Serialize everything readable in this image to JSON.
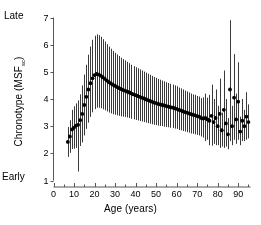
{
  "chart_data": {
    "type": "scatter",
    "title": "",
    "xlabel": "Age (years)",
    "ylabel": "Chronotype (MSF",
    "ylabel_subscript": "sc",
    "ylabel_suffix": ")",
    "xlim": [
      0,
      96
    ],
    "ylim": [
      1,
      7
    ],
    "xticks": [
      0,
      10,
      20,
      30,
      40,
      50,
      60,
      70,
      80,
      90
    ],
    "xtick_labels": [
      "0",
      "10",
      "20",
      "30",
      "40",
      "50",
      "60",
      "70",
      "80",
      "90"
    ],
    "xminor_step": 5,
    "yticks": [
      1,
      2,
      3,
      4,
      5,
      6,
      7
    ],
    "ytick_labels": [
      "1",
      "2",
      "3",
      "4",
      "5",
      "6",
      "7"
    ],
    "grid": false,
    "legend": false,
    "pole_labels": {
      "high": "Late",
      "low": "Early"
    },
    "marker_color": "#000000",
    "errorbar_color": "#3a3a3a",
    "axis_color": "#555555",
    "series": [
      {
        "name": "Mean chronotype (MSFsc) by age with SD error bars",
        "x": [
          7,
          8,
          9,
          10,
          11,
          12,
          13,
          14,
          15,
          16,
          17,
          18,
          19,
          20,
          21,
          22,
          23,
          24,
          25,
          26,
          27,
          28,
          29,
          30,
          31,
          32,
          33,
          34,
          35,
          36,
          37,
          38,
          39,
          40,
          41,
          42,
          43,
          44,
          45,
          46,
          47,
          48,
          49,
          50,
          51,
          52,
          53,
          54,
          55,
          56,
          57,
          58,
          59,
          60,
          61,
          62,
          63,
          64,
          65,
          66,
          67,
          68,
          69,
          70,
          71,
          72,
          73,
          74,
          75,
          76,
          77,
          78,
          79,
          80,
          81,
          82,
          83,
          84,
          85,
          86,
          87,
          88,
          89,
          90,
          91,
          92,
          93,
          94,
          95
        ],
        "y": [
          2.42,
          2.62,
          2.88,
          2.95,
          3.02,
          3.05,
          3.22,
          3.45,
          3.78,
          4.08,
          4.35,
          4.58,
          4.76,
          4.88,
          4.92,
          4.9,
          4.86,
          4.8,
          4.74,
          4.68,
          4.62,
          4.57,
          4.52,
          4.48,
          4.44,
          4.4,
          4.36,
          4.33,
          4.3,
          4.27,
          4.24,
          4.2,
          4.17,
          4.14,
          4.11,
          4.08,
          4.05,
          4.02,
          3.99,
          3.96,
          3.93,
          3.9,
          3.87,
          3.85,
          3.82,
          3.8,
          3.78,
          3.76,
          3.74,
          3.72,
          3.7,
          3.68,
          3.66,
          3.64,
          3.6,
          3.58,
          3.55,
          3.52,
          3.5,
          3.47,
          3.44,
          3.42,
          3.4,
          3.37,
          3.35,
          3.3,
          3.28,
          3.3,
          3.25,
          3.2,
          3.38,
          3.15,
          3.3,
          3.0,
          3.45,
          2.85,
          3.6,
          3.1,
          2.7,
          4.35,
          3.0,
          4.05,
          3.25,
          3.9,
          2.8,
          3.2,
          3.0,
          3.35,
          3.15
        ],
        "yerr_lower": [
          0.55,
          0.6,
          0.72,
          0.78,
          0.82,
          1.72,
          0.95,
          1.05,
          1.12,
          1.18,
          1.22,
          1.24,
          1.25,
          1.25,
          1.24,
          1.22,
          1.2,
          1.18,
          1.16,
          1.14,
          1.12,
          1.1,
          1.08,
          1.06,
          1.04,
          1.02,
          1.0,
          0.98,
          0.96,
          0.95,
          0.94,
          0.93,
          0.92,
          0.91,
          0.9,
          0.89,
          0.88,
          0.87,
          0.86,
          0.85,
          0.84,
          0.83,
          0.82,
          0.81,
          0.8,
          0.79,
          0.78,
          0.78,
          0.77,
          0.76,
          0.76,
          0.75,
          0.75,
          0.74,
          0.74,
          0.73,
          0.73,
          0.72,
          0.72,
          0.71,
          0.71,
          0.7,
          0.7,
          0.69,
          0.69,
          0.68,
          0.7,
          0.85,
          0.75,
          0.9,
          1.1,
          0.8,
          1.0,
          0.7,
          1.25,
          0.6,
          1.4,
          0.85,
          0.55,
          1.9,
          0.7,
          1.55,
          0.9,
          1.4,
          0.5,
          0.75,
          0.55,
          0.85,
          0.6
        ],
        "yerr_upper": [
          0.55,
          0.6,
          0.72,
          0.78,
          0.82,
          0.9,
          0.95,
          1.05,
          1.12,
          1.18,
          1.28,
          1.35,
          1.42,
          1.45,
          1.46,
          1.45,
          1.43,
          1.4,
          1.37,
          1.34,
          1.31,
          1.28,
          1.25,
          1.22,
          1.2,
          1.18,
          1.16,
          1.14,
          1.12,
          1.1,
          1.08,
          1.06,
          1.04,
          1.03,
          1.02,
          1.01,
          1.0,
          0.99,
          0.98,
          0.97,
          0.96,
          0.95,
          0.94,
          0.93,
          0.92,
          0.91,
          0.9,
          0.89,
          0.88,
          0.87,
          0.86,
          0.85,
          0.84,
          0.83,
          0.82,
          0.81,
          0.8,
          0.79,
          0.78,
          0.77,
          0.76,
          0.75,
          0.75,
          0.74,
          0.74,
          0.73,
          0.78,
          0.9,
          0.8,
          0.95,
          1.15,
          0.85,
          1.05,
          0.75,
          1.3,
          0.65,
          1.45,
          0.9,
          0.6,
          2.55,
          0.75,
          1.6,
          0.95,
          1.45,
          0.55,
          0.8,
          0.6,
          0.9,
          0.65
        ]
      }
    ]
  }
}
